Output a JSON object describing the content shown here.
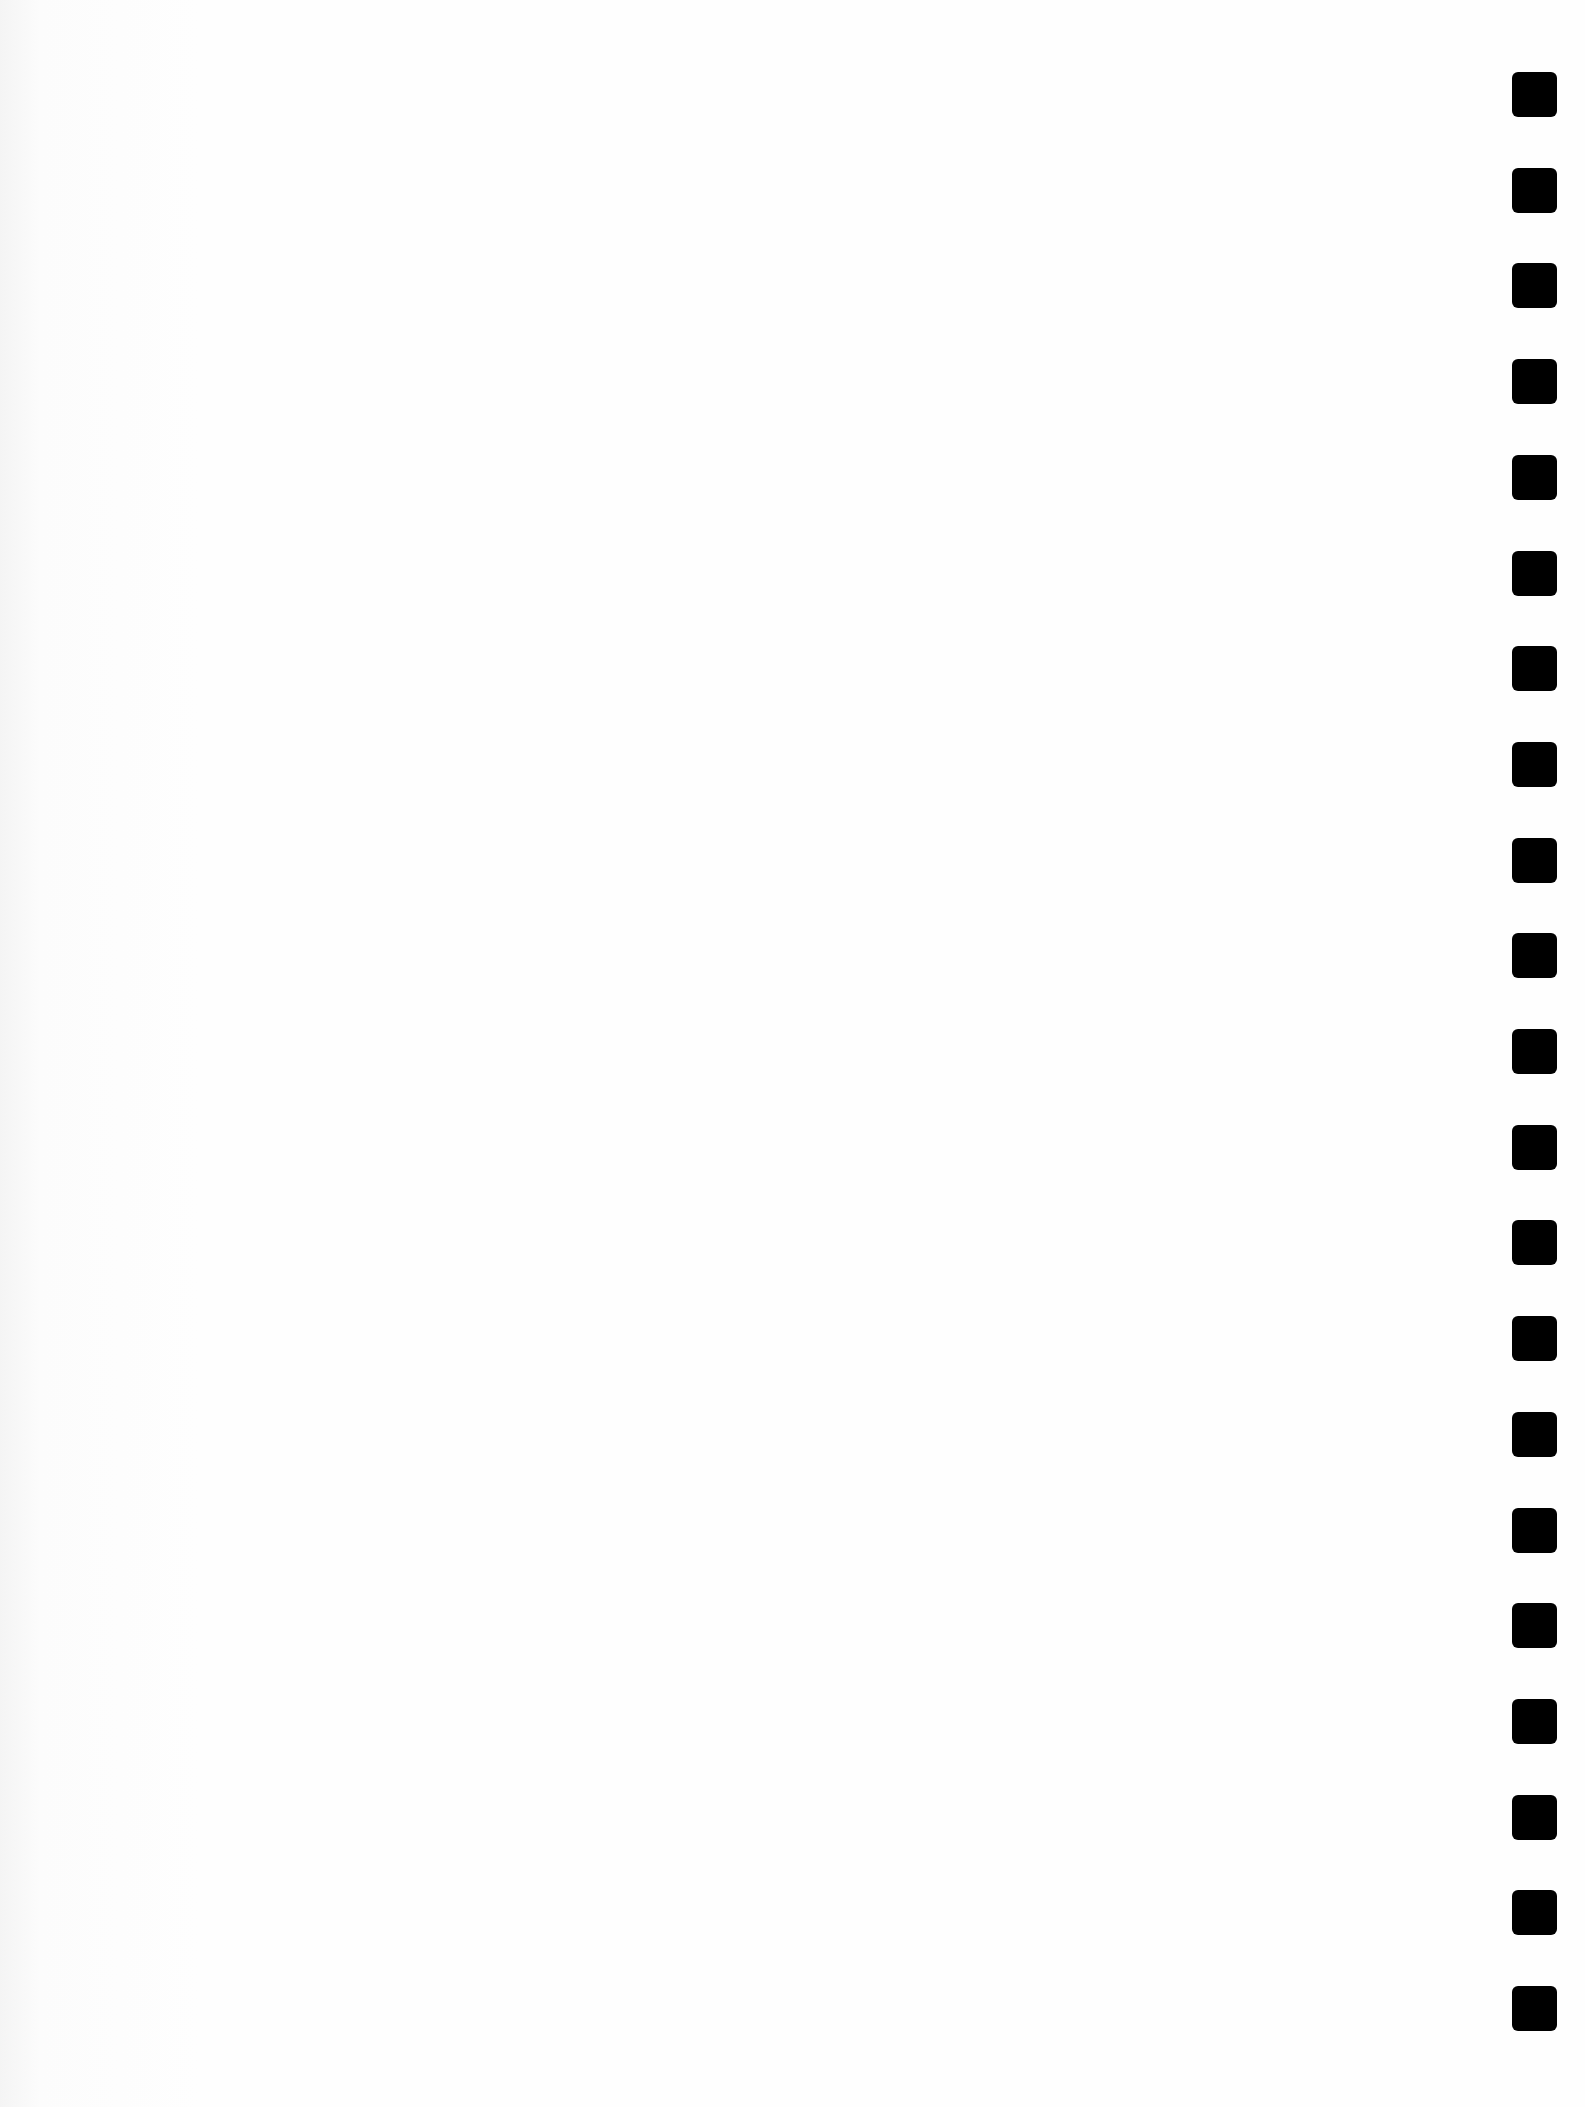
{
  "page": {
    "type": "blank-notebook-page",
    "background_color": "#fdfdfd",
    "content_text": ""
  },
  "binding_holes": {
    "count": 21,
    "color": "#000000",
    "size_px": 45,
    "x_px": 1512,
    "first_top_px": 72,
    "spacing_px": 95.7
  }
}
